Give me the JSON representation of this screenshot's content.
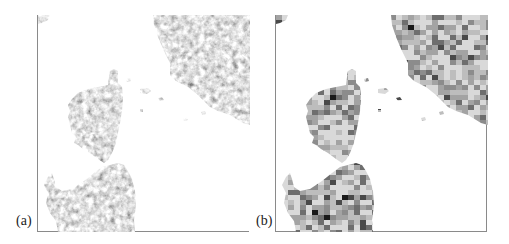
{
  "figure": {
    "panels": [
      {
        "id": "a",
        "label": "(a)",
        "description": "High-resolution grayscale land-cover map (Corsica, Sardinia, Italian coast)"
      },
      {
        "id": "b",
        "label": "(b)",
        "description": "Coarse-resolution pixelated grayscale map of same region"
      }
    ],
    "colors": {
      "sea": "#ffffff",
      "frame": "#8a8a8a",
      "land_palette": [
        "#d9d9d9",
        "#bdbdbd",
        "#a3a3a3",
        "#8c8c8c",
        "#6e6e6e",
        "#4a4a4a",
        "#1a1a1a"
      ]
    }
  }
}
